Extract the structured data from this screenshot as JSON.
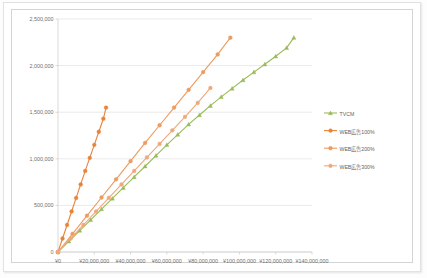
{
  "chart_data": {
    "type": "line",
    "title": "",
    "xlabel": "",
    "ylabel": "",
    "xlim": [
      0,
      140000000
    ],
    "ylim": [
      0,
      2500000
    ],
    "grid": true,
    "legend_position": "right",
    "x_tick_labels": [
      "¥0",
      "¥20,000,000",
      "¥40,000,000",
      "¥60,000,000",
      "¥80,000,000",
      "¥100,000,000",
      "¥120,000,000",
      "¥140,000,000"
    ],
    "x_tick_values": [
      0,
      20000000,
      40000000,
      60000000,
      80000000,
      100000000,
      120000000,
      140000000
    ],
    "y_tick_labels": [
      "0",
      "500,000",
      "1,000,000",
      "1,500,000",
      "2,000,000",
      "2,500,000"
    ],
    "y_tick_values": [
      0,
      500000,
      1000000,
      1500000,
      2000000,
      2500000
    ],
    "series": [
      {
        "name": "TVCM",
        "color": "#9BBB59",
        "marker": "triangle",
        "x": [
          0,
          6000000,
          12000000,
          18000000,
          24000000,
          30000000,
          36000000,
          42000000,
          48000000,
          54000000,
          60000000,
          66000000,
          72000000,
          78000000,
          84000000,
          90000000,
          96000000,
          102000000,
          108000000,
          114000000,
          120000000,
          126000000,
          130000000
        ],
        "y": [
          0,
          115000,
          230000,
          345000,
          460000,
          575000,
          690000,
          805000,
          920000,
          1035000,
          1150000,
          1260000,
          1370000,
          1470000,
          1570000,
          1665000,
          1755000,
          1845000,
          1930000,
          2015000,
          2100000,
          2190000,
          2300000
        ]
      },
      {
        "name": "WEB広告100%",
        "color": "#E8833A",
        "marker": "circle",
        "x": [
          0,
          2500000,
          5000000,
          7500000,
          10000000,
          12500000,
          15000000,
          17500000,
          20000000,
          22500000,
          25000000,
          26500000
        ],
        "y": [
          0,
          145000,
          290000,
          435000,
          580000,
          725000,
          870000,
          1010000,
          1150000,
          1290000,
          1430000,
          1550000
        ]
      },
      {
        "name": "WEB広告200%",
        "color": "#ED9B5E",
        "marker": "circle",
        "x": [
          0,
          8000000,
          16000000,
          24000000,
          32000000,
          40000000,
          48000000,
          56000000,
          64000000,
          72000000,
          80000000,
          88000000,
          95000000
        ],
        "y": [
          0,
          195000,
          390000,
          585000,
          780000,
          975000,
          1170000,
          1360000,
          1550000,
          1740000,
          1930000,
          2120000,
          2300000
        ]
      },
      {
        "name": "WEB広告300%",
        "color": "#F0A87A",
        "marker": "circle",
        "x": [
          0,
          7000000,
          14000000,
          21000000,
          28000000,
          35000000,
          42000000,
          49000000,
          56000000,
          63000000,
          70000000,
          77000000,
          84000000
        ],
        "y": [
          0,
          145000,
          290000,
          435000,
          580000,
          725000,
          870000,
          1015000,
          1160000,
          1305000,
          1450000,
          1600000,
          1760000
        ]
      }
    ],
    "legend_entries": [
      {
        "label": "TVCM",
        "color": "#9BBB59",
        "marker": "triangle"
      },
      {
        "label": "WEB広告100%",
        "color": "#E8833A",
        "marker": "circle"
      },
      {
        "label": "WEB広告200%",
        "color": "#ED9B5E",
        "marker": "circle"
      },
      {
        "label": "WEB広告300%",
        "color": "#F0A87A",
        "marker": "circle"
      }
    ]
  }
}
